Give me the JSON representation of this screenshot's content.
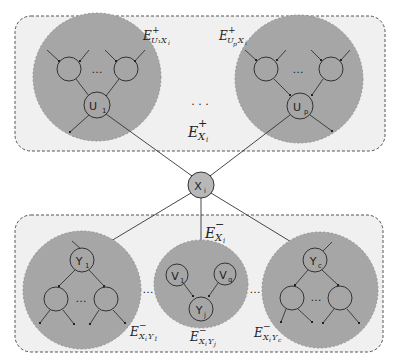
{
  "diagram": {
    "type": "markov-blanket-partition",
    "colors": {
      "background": "#ffffff",
      "container_fill": "#f0f0f0",
      "container_border": "#555555",
      "cluster_fill": "#a6a6a6",
      "center_node_fill": "#b8b8b8",
      "edge": "#333333"
    },
    "center_node": {
      "label": "X",
      "sub": "i"
    },
    "top_container": {
      "label": {
        "base": "E",
        "sup": "+",
        "sub": "X_i"
      },
      "ellipsis": ". . .",
      "clusters": [
        {
          "id": "u1",
          "node": {
            "label": "U",
            "sub": "1"
          },
          "edge_label": {
            "base": "E",
            "sup": "+",
            "sub": "U₁X_i"
          },
          "ellipsis": "…"
        },
        {
          "id": "up",
          "node": {
            "label": "U",
            "sub": "p"
          },
          "edge_label": {
            "base": "E",
            "sup": "+",
            "sub": "U_pX_i"
          },
          "ellipsis": "…"
        }
      ]
    },
    "bottom_container": {
      "label": {
        "base": "E",
        "sup": "−",
        "sub": "X_i"
      },
      "clusters": [
        {
          "id": "y1",
          "node": {
            "label": "Y",
            "sub": "1"
          },
          "edge_label": {
            "base": "E",
            "sup": "−",
            "sub": "X_iY₁"
          },
          "ellipsis": "…"
        },
        {
          "id": "yj",
          "node": {
            "label": "Y",
            "sub": "j"
          },
          "parents": [
            {
              "label": "V",
              "sub": "1"
            },
            {
              "label": "V",
              "sub": "q"
            }
          ],
          "edge_label": {
            "base": "E",
            "sup": "−",
            "sub": "X_iY_j"
          }
        },
        {
          "id": "yc",
          "node": {
            "label": "Y",
            "sub": "c"
          },
          "edge_label": {
            "base": "E",
            "sup": "−",
            "sub": "X_iY_c"
          },
          "ellipsis": "…"
        }
      ],
      "between_ellipsis": "…"
    }
  }
}
